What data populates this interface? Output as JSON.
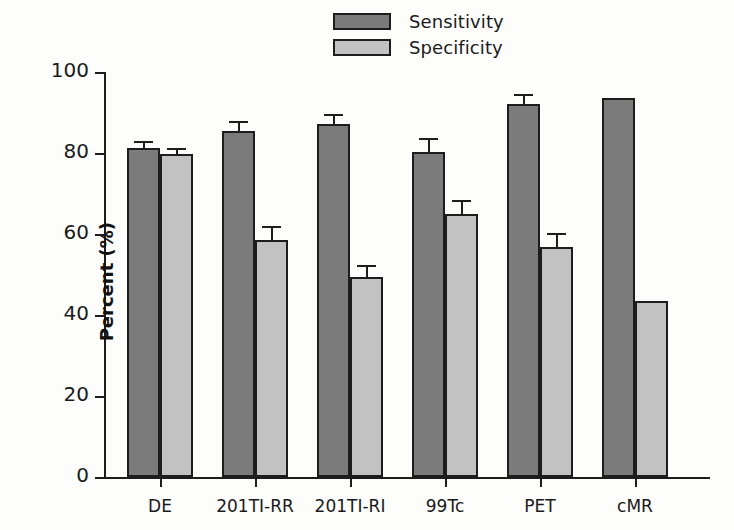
{
  "chart_data": {
    "type": "bar",
    "title": "",
    "xlabel": "",
    "ylabel": "Percent (%)",
    "ylim": [
      0,
      100
    ],
    "yticks": [
      0,
      20,
      40,
      60,
      80,
      100
    ],
    "ytick_labels": [
      "0",
      "20",
      "40",
      "60",
      "80",
      "100"
    ],
    "grid": false,
    "legend_position": "top-center",
    "categories": [
      "DE",
      "201TI-RR",
      "201TI-RI",
      "99Tc",
      "PET",
      "cMR"
    ],
    "series": [
      {
        "name": "Sensitivity",
        "color": "#7b7b7b",
        "values": [
          81.3,
          85.5,
          87.2,
          80.2,
          92.0,
          93.5
        ],
        "errors": [
          1.2,
          2.0,
          2.0,
          3.0,
          2.0,
          0
        ]
      },
      {
        "name": "Specificity",
        "color": "#c2c2c2",
        "values": [
          79.8,
          58.4,
          49.3,
          65.0,
          56.7,
          43.4
        ],
        "errors": [
          1.0,
          3.0,
          2.5,
          3.0,
          3.0,
          0
        ]
      }
    ]
  },
  "legend": {
    "items": [
      {
        "label": "Sensitivity",
        "color": "#7b7b7b"
      },
      {
        "label": "Specificity",
        "color": "#c2c2c2"
      }
    ]
  },
  "axes": {
    "y_title": "Percent (%)"
  }
}
